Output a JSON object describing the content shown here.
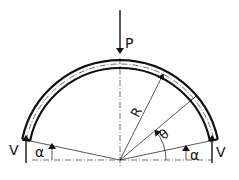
{
  "diagram": {
    "type": "engineering-free-body",
    "colors": {
      "line": "#111111",
      "background": "#ffffff"
    },
    "labels": {
      "load": "P",
      "reaction_left": "V",
      "reaction_right": "V",
      "radius": "R",
      "angle_theta": "θ",
      "angle_alpha_left": "α",
      "angle_alpha_right": "α"
    }
  }
}
